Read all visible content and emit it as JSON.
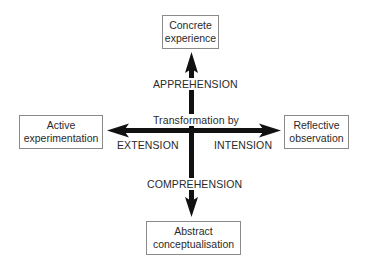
{
  "diagram": {
    "type": "cross-axis concept diagram",
    "nodes": {
      "top": {
        "label": "Concrete\nexperience"
      },
      "left": {
        "label": "Active\nexperimentation"
      },
      "right": {
        "label": "Reflective\nobservation"
      },
      "bottom": {
        "label": "Abstract\nconceptualisation"
      }
    },
    "axis_labels": {
      "up": "APPREHENSION",
      "down": "COMPREHENSION",
      "left": "EXTENSION",
      "right": "INTENSION",
      "center": "Transformation by"
    },
    "colors": {
      "arrow": "#111111",
      "box_border": "#8a8a8a",
      "text": "#2a2a2a",
      "background": "#ffffff"
    },
    "edges": [
      {
        "from": "center",
        "to": "top",
        "label": "APPREHENSION"
      },
      {
        "from": "center",
        "to": "bottom",
        "label": "COMPREHENSION"
      },
      {
        "from": "center",
        "to": "left",
        "label": "EXTENSION"
      },
      {
        "from": "center",
        "to": "right",
        "label": "INTENSION"
      }
    ]
  }
}
